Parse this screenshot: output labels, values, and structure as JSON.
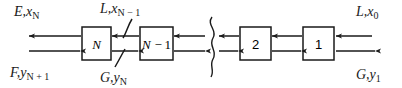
{
  "diagram": {
    "stroke_color": "#1a1a1a",
    "text_color": "#1a1a1a",
    "background": "#ffffff",
    "stages": [
      {
        "id": "stage-N",
        "label": "N",
        "label_main": "N",
        "label_sub": ""
      },
      {
        "id": "stage-N-minus-1",
        "label": "N − 1",
        "label_main": "N −",
        "label_sub": "1"
      },
      {
        "id": "stage-2",
        "label": "2",
        "label_main": "2",
        "label_sub": ""
      },
      {
        "id": "stage-1",
        "label": "1",
        "label_main": "1",
        "label_sub": ""
      }
    ],
    "break_symbol": "}",
    "labels": {
      "top_left": {
        "id": "label-E-xN",
        "main": "E,x",
        "sub": "N"
      },
      "bottom_left": {
        "id": "label-F-yN1",
        "main": "F,y",
        "sub": "N + 1"
      },
      "top_mid": {
        "id": "label-L-xN1",
        "main": "L,x",
        "sub": "N − 1"
      },
      "bottom_mid": {
        "id": "label-G-yN",
        "main": "G,y",
        "sub": "N"
      },
      "top_right": {
        "id": "label-L-x0",
        "main": "L,x",
        "sub": "0"
      },
      "bottom_right": {
        "id": "label-G-y1",
        "main": "G,y",
        "sub": "1"
      }
    },
    "flows": {
      "upper_direction": "leftward",
      "lower_direction": "rightward"
    }
  }
}
